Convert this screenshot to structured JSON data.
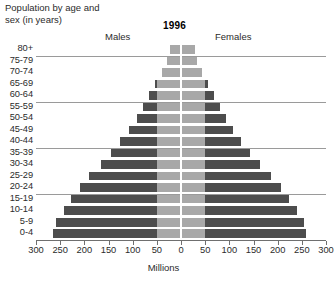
{
  "header": {
    "title": "Population by age and\nsex (in years)",
    "year": "1996",
    "males_label": "Males",
    "females_label": "Females"
  },
  "axis": {
    "x_title": "Millions",
    "tick_labels": [
      "300",
      "250",
      "200",
      "150",
      "100",
      "50",
      "0",
      "50",
      "100",
      "150",
      "200",
      "250",
      "300"
    ],
    "tick_values": [
      -300,
      -250,
      -200,
      -150,
      -100,
      -50,
      0,
      50,
      100,
      150,
      200,
      250,
      300
    ]
  },
  "colors": {
    "bar_dark": "#4d4d4d",
    "bar_light": "#a8a8a8",
    "gridline": "#9a9a9a",
    "axis": "#6f6f6f",
    "text": "#2b2b2b"
  },
  "chart_data": {
    "type": "bar",
    "subtype": "population-pyramid",
    "title": "Population by age and sex (in years)",
    "annotation": "1996",
    "xlabel": "Millions",
    "ylabel": "",
    "xlim": [
      -300,
      300
    ],
    "xtick_step": 50,
    "grid": true,
    "grid_after_categories": [
      "80+",
      "60-64",
      "40-44",
      "20-24"
    ],
    "legend": [
      "Males",
      "Females"
    ],
    "legend_position": "top",
    "categories": [
      "80+",
      "75-79",
      "70-74",
      "65-69",
      "60-64",
      "55-59",
      "50-54",
      "45-49",
      "40-44",
      "35-39",
      "30-34",
      "25-29",
      "20-24",
      "15-19",
      "10-14",
      "5-9",
      "0-4"
    ],
    "series": [
      {
        "name": "Males",
        "side": "left",
        "units": "millions",
        "values": [
          22,
          29,
          40,
          53,
          66,
          79,
          92,
          107,
          126,
          145,
          165,
          190,
          208,
          227,
          243,
          258,
          264
        ]
      },
      {
        "name": "Females",
        "side": "right",
        "units": "millions",
        "values": [
          28,
          33,
          44,
          55,
          68,
          80,
          93,
          108,
          125,
          143,
          163,
          187,
          206,
          224,
          240,
          255,
          258
        ]
      }
    ],
    "shading_note": "Inner band 0-50 million rendered light gray; portion beyond 50 million rendered dark gray."
  }
}
